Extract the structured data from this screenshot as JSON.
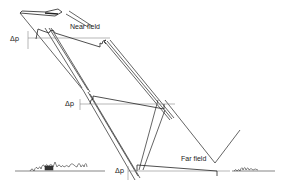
{
  "diagram": {
    "labels": {
      "near_field": "Near field",
      "far_field": "Far field",
      "dp_top": "Δp",
      "dp_mid": "Δp",
      "dp_bottom": "Δp"
    },
    "elements": [
      {
        "id": "aircraft",
        "type": "aircraft-silhouette"
      },
      {
        "id": "near-field-signature",
        "type": "multi-shock pressure wave"
      },
      {
        "id": "mid-field-signature",
        "type": "N-wave forming"
      },
      {
        "id": "far-field-signature",
        "type": "N-wave"
      },
      {
        "id": "ground",
        "type": "ground-line with trees and buildings"
      }
    ],
    "colors": {
      "line": "#222222",
      "axis": "#888888",
      "background": "#ffffff"
    }
  }
}
